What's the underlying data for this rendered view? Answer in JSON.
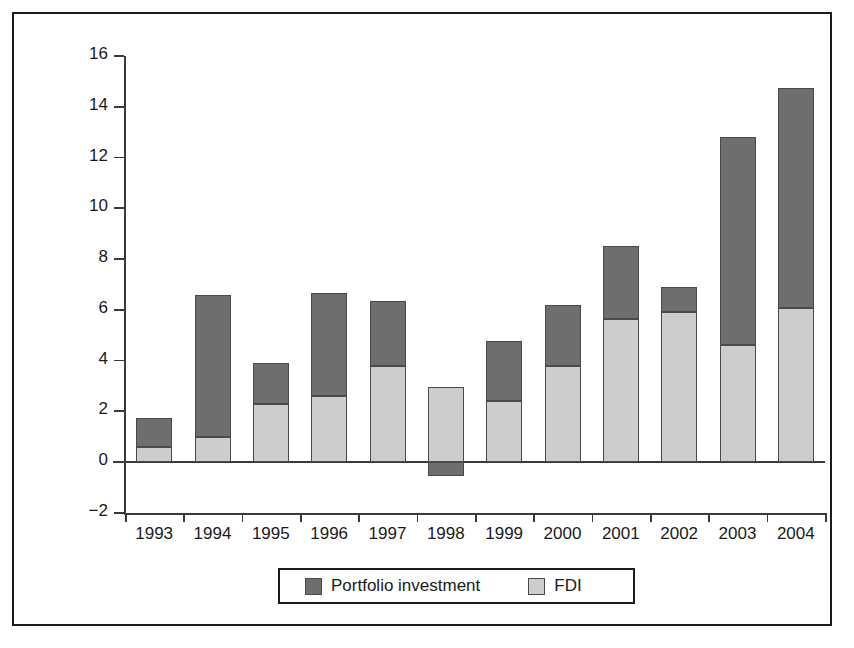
{
  "chart_data": {
    "type": "bar",
    "stacked": true,
    "title": "",
    "subtitle": "",
    "xlabel": "",
    "ylabel": "US$ (billions)",
    "categories": [
      "1993",
      "1994",
      "1995",
      "1996",
      "1997",
      "1998",
      "1999",
      "2000",
      "2001",
      "2002",
      "2003",
      "2004"
    ],
    "series": [
      {
        "name": "FDI",
        "color": "#cdcdcd",
        "values": [
          0.6,
          1.0,
          2.3,
          2.6,
          3.8,
          2.95,
          2.4,
          3.8,
          5.65,
          5.9,
          4.6,
          6.05
        ]
      },
      {
        "name": "Portfolio investment",
        "color": "#6e6e6e",
        "values": [
          1.15,
          5.6,
          1.6,
          4.05,
          2.55,
          -0.55,
          2.35,
          2.4,
          2.85,
          1.0,
          8.2,
          8.7
        ]
      }
    ],
    "totals": [
      1.75,
      6.6,
      3.9,
      6.65,
      6.35,
      2.95,
      4.75,
      6.2,
      8.5,
      6.9,
      12.8,
      14.75
    ],
    "ylim": [
      -2,
      16
    ],
    "ytick_labels": [
      "16",
      "14",
      "12",
      "10",
      "8",
      "6",
      "4",
      "2",
      "0",
      "−2"
    ],
    "ytick_values": [
      16,
      14,
      12,
      10,
      8,
      6,
      4,
      2,
      0,
      -2
    ],
    "grid": false,
    "legend_position": "bottom",
    "legend_entries": [
      "Portfolio investment",
      "FDI"
    ]
  },
  "legend": {
    "portfolio_label": "Portfolio investment",
    "fdi_label": "FDI"
  },
  "axis": {
    "y_title": "US$ (billions)"
  }
}
